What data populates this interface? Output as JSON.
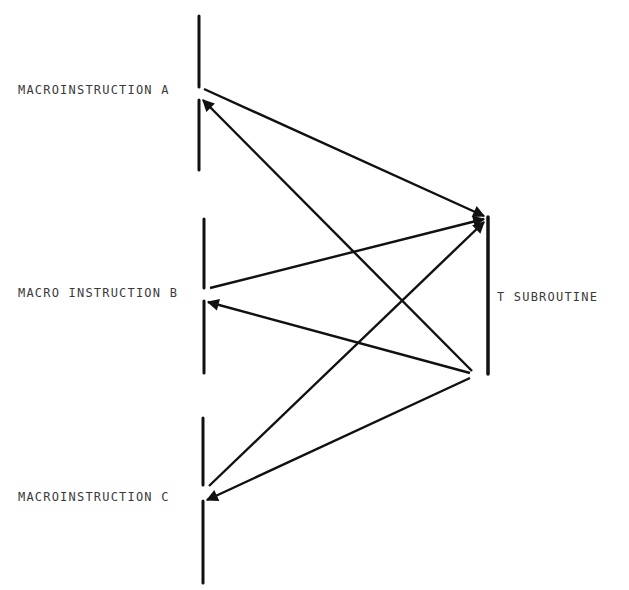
{
  "diagram": {
    "type": "call-return flow diagram",
    "colors": {
      "line": "#111111",
      "text": "#3a3a3a",
      "background": "#ffffff"
    },
    "nodes": [
      {
        "id": "A",
        "label": "MACROINSTRUCTION A"
      },
      {
        "id": "B",
        "label": "MACRO INSTRUCTION B"
      },
      {
        "id": "C",
        "label": "MACROINSTRUCTION C"
      },
      {
        "id": "T",
        "label": "T SUBROUTINE"
      }
    ],
    "edges": [
      {
        "from": "A",
        "to": "T",
        "kind": "call"
      },
      {
        "from": "B",
        "to": "T",
        "kind": "call"
      },
      {
        "from": "C",
        "to": "T",
        "kind": "call"
      },
      {
        "from": "T",
        "to": "A",
        "kind": "return"
      },
      {
        "from": "T",
        "to": "B",
        "kind": "return"
      },
      {
        "from": "T",
        "to": "C",
        "kind": "return"
      }
    ]
  }
}
